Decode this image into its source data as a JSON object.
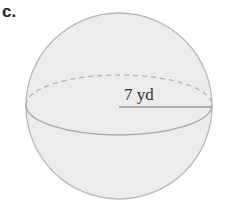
{
  "problem_label": "c.",
  "figure": {
    "shape": "sphere",
    "radius_label": "7 yd",
    "colors": {
      "fill": "#ececec",
      "outline": "#b8b8b8",
      "equator_back": "#b0b0b0",
      "equator_front": "#a8a8a8",
      "radius_line": "#9a9a9a",
      "text": "#333333"
    }
  }
}
